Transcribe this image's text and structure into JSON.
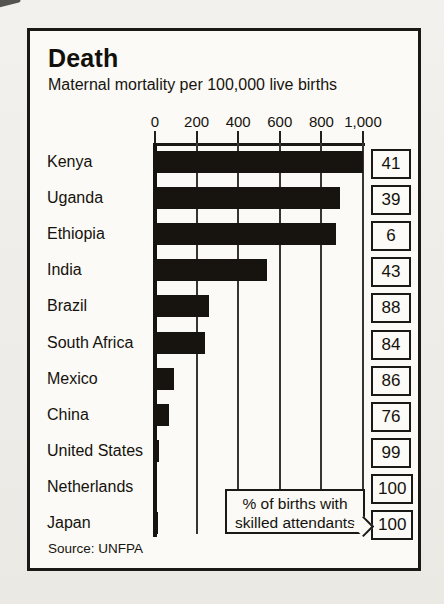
{
  "chart_data": {
    "type": "bar",
    "orientation": "horizontal",
    "title": "Death",
    "subtitle": "Maternal mortality per 100,000 live births",
    "categories": [
      "Kenya",
      "Uganda",
      "Ethiopia",
      "India",
      "Brazil",
      "South Africa",
      "Mexico",
      "China",
      "United States",
      "Netherlands",
      "Japan"
    ],
    "series": [
      {
        "name": "Maternal mortality per 100,000 live births",
        "values": [
          1000,
          890,
          870,
          540,
          260,
          240,
          90,
          65,
          20,
          10,
          15
        ]
      },
      {
        "name": "% of births with skilled attendants",
        "values": [
          41,
          39,
          6,
          43,
          88,
          84,
          86,
          76,
          99,
          100,
          100
        ]
      }
    ],
    "xlim": [
      0,
      1000
    ],
    "x_ticks": [
      {
        "value": 0,
        "label": "0"
      },
      {
        "value": 200,
        "label": "200"
      },
      {
        "value": 400,
        "label": "400"
      },
      {
        "value": 600,
        "label": "600"
      },
      {
        "value": 800,
        "label": "800"
      },
      {
        "value": 1000,
        "label": "1,000"
      }
    ],
    "axis_position": "top",
    "grid": "vertical",
    "callout": {
      "line1": "% of births with",
      "line2": "skilled attendants"
    },
    "source": "Source: UNFPA",
    "colors": {
      "bar": "#17140f",
      "gridline": "#38352f",
      "border": "#1b1916",
      "panel_bg": "#fbfaf6",
      "page_bg": "#f0efeb",
      "text": "#14110c"
    }
  }
}
